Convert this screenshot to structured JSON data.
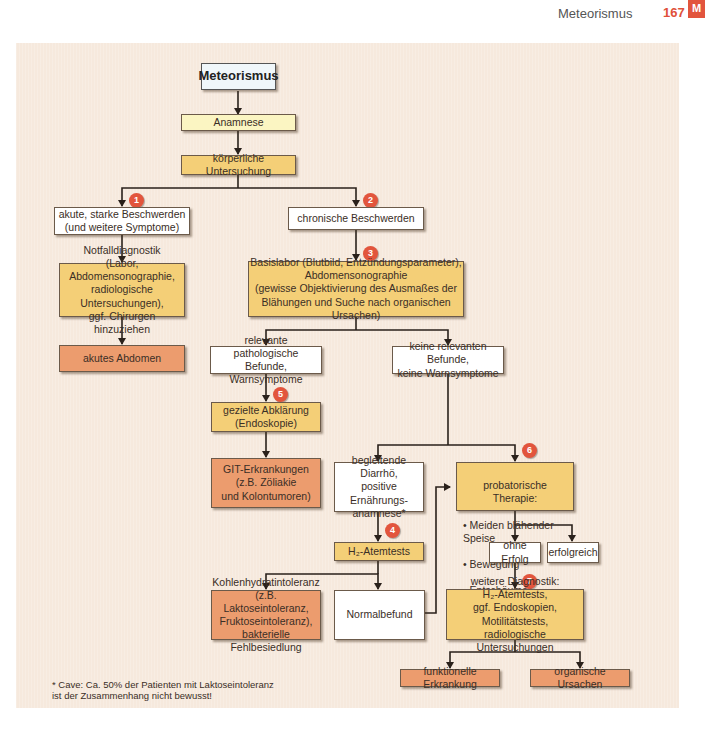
{
  "header": {
    "section_title": "Meteorismus",
    "page_number": "167",
    "chapter_tab": "M"
  },
  "flow": {
    "title": "Meteorismus",
    "anamnese": "Anamnese",
    "koerperlich": "körperliche Untersuchung",
    "akut": "akute, starke Beschwerden\n(und weitere Symptome)",
    "chronisch": "chronische Beschwerden",
    "notfall": "Notfalldiagnostik\n(Labor, Abdomensonographie,\nradiologische Untersuchungen),\nggf. Chirurgen hinzuziehen",
    "akutes_abdomen": "akutes Abdomen",
    "basislabor": "Basislabor (Blutbild, Entzündungsparameter),\nAbdomensonographie\n(gewisse Objektivierung des Ausmaßes der\nBlähungen und Suche nach organischen Ursachen)",
    "relevante": "relevante pathologische\nBefunde, Warnsymptome",
    "keine": "keine relevanten Befunde,\nkeine Warnsymptome",
    "gezielte": "gezielte Abklärung\n(Endoskopie)",
    "git": "GIT-Erkrankungen\n(z.B. Zöliakie\nund Kolontumoren)",
    "diarrhoe": "begleitende Diarrhö,\npositive Ernährungs-\nanamnese*",
    "h2": "H₂-Atemtests",
    "kohlenhydrat": "Kohlenhydratintoleranz\n(z.B. Laktoseintoleranz,\nFruktoseintoleranz),\nbakterielle Fehlbesiedlung",
    "normalbefund": "Normalbefund",
    "therapie": {
      "heading": "probatorische Therapie:",
      "items": [
        "• Meiden blähender Speise",
        "• Bewegung",
        "• Entschäumer"
      ]
    },
    "ohne_erfolg": "ohne Erfolg",
    "erfolgreich": "erfolgreich",
    "weitere": "weitere Diagnostik:\nH₂-Atemtests,\nggf. Endoskopien, Motilitätstests,\nradiologische Untersuchungen",
    "funktionelle": "funktionelle Erkrankung",
    "organische": "organische Ursachen"
  },
  "badges": [
    "1",
    "2",
    "3",
    "4",
    "5",
    "6",
    "7"
  ],
  "footnote": "* Cave: Ca. 50% der Patienten mit Laktoseintoleranz\n  ist der Zusammenhang nicht bewusst!",
  "colors": {
    "panel": "#f6e9dd",
    "white_box": "#ffffff",
    "light_yellow": "#fbf5c2",
    "gold": "#f4cf77",
    "orange": "#ec9c6e",
    "badge": "#e2553d"
  }
}
